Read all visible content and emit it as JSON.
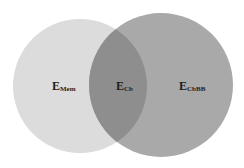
{
  "diagram": {
    "type": "venn",
    "sets": [
      {
        "id": "left",
        "label_main": "E",
        "label_sub": "Mem",
        "color": "#dcdcdc"
      },
      {
        "id": "right",
        "label_main": "E",
        "label_sub": "CbBB",
        "color": "#a9a9a9"
      }
    ],
    "intersection": {
      "label_main": "E",
      "label_sub": "Cb",
      "color": "#8e8e8e"
    }
  }
}
